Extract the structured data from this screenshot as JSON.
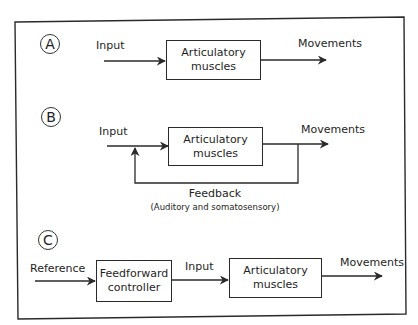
{
  "figure": {
    "panels": [
      {
        "id": "A",
        "input_label": "Input",
        "box_line1": "Articulatory",
        "box_line2": "muscles",
        "output_label": "Movements"
      },
      {
        "id": "B",
        "input_label": "Input",
        "box_line1": "Articulatory",
        "box_line2": "muscles",
        "output_label": "Movements",
        "feedback_label": "Feedback",
        "feedback_sublabel": "(Auditory and somatosensory)"
      },
      {
        "id": "C",
        "reference_label": "Reference",
        "controller_line1": "Feedforward",
        "controller_line2": "controller",
        "input_label": "Input",
        "box_line1": "Articulatory",
        "box_line2": "muscles",
        "output_label": "Movements"
      }
    ],
    "colors": {
      "stroke": "#2a2a2a",
      "background": "#ffffff"
    }
  }
}
